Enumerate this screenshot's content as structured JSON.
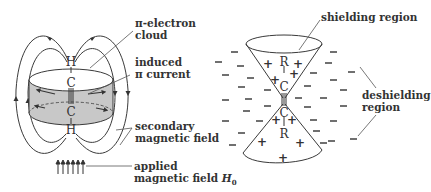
{
  "left_figure": {
    "title": "Acetylene in applied magnetic field",
    "atoms": {
      "top_h": "H",
      "top_c": "C",
      "bottom_c": "C",
      "bottom_h": "H"
    },
    "labels": {
      "pi_cloud_line1": "π-electron",
      "pi_cloud_line2": "cloud",
      "induced_line1": "induced",
      "induced_line2": "π current",
      "secondary_line1": "secondary",
      "secondary_line2": "magnetic field",
      "applied_line1": "applied",
      "applied_line2": "magnetic field ",
      "applied_symbol": "H",
      "applied_subscript": "0"
    },
    "colors": {
      "cloud_fill": "#c8c8c8",
      "line": "#3a3a3a"
    }
  },
  "right_figure": {
    "title": "Shielding cones of alkyne",
    "atoms": {
      "top_r": "R",
      "top_c": "C",
      "bottom_c": "C",
      "bottom_r": "R"
    },
    "labels": {
      "shielding": "shielding region",
      "deshielding_line1": "deshielding",
      "deshielding_line2": "region"
    },
    "inside_sign": "+",
    "outside_sign": "−"
  }
}
